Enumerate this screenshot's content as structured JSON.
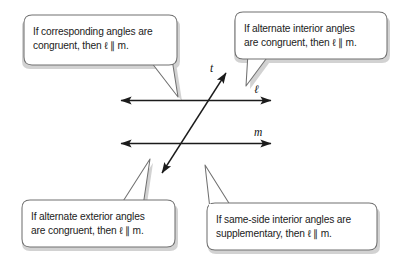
{
  "figure": {
    "background_color": "#ffffff",
    "ink_color": "#1b1b1b",
    "bubble_fill": "#ffffff",
    "bubble_stroke": "#6e6e6e",
    "bubble_shadow": "#cfcfcf"
  },
  "callouts": [
    {
      "id": "corresponding-angles",
      "position": "top-left",
      "line1": "If corresponding angles are",
      "line2": "congruent, then ℓ ∥ m.",
      "text": "If corresponding angles are\ncongruent, then ℓ ∥ m."
    },
    {
      "id": "alternate-interior-angles",
      "position": "top-right",
      "line1": "If alternate interior angles",
      "line2": "are congruent, then ℓ ∥ m.",
      "text": "If alternate interior angles\nare congruent, then ℓ ∥ m."
    },
    {
      "id": "alternate-exterior-angles",
      "position": "bottom-left",
      "line1": "If alternate exterior angles",
      "line2": "are congruent, then ℓ ∥ m.",
      "text": "If alternate exterior angles\nare congruent, then ℓ ∥ m."
    },
    {
      "id": "same-side-interior-angles",
      "position": "bottom-right",
      "line1": "If same-side interior angles are",
      "line2": "supplementary, then ℓ ∥ m.",
      "text": "If same-side interior angles are\nsupplementary, then ℓ ∥ m."
    }
  ],
  "diagram": {
    "line_l_label": "ℓ",
    "line_m_label": "m",
    "transversal_label": "t"
  }
}
